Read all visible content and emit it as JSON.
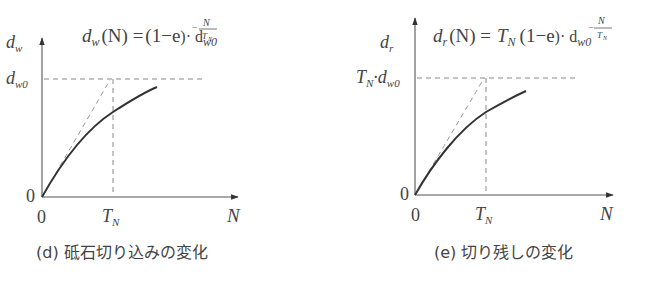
{
  "figures": [
    {
      "id": "d",
      "caption": "(d) 砥石切り込みの変化",
      "formula": {
        "lhs": "d",
        "lhs_sub": "w",
        "lhs_arg": "(N) =",
        "pre": "",
        "pre_sub": "",
        "body": "(1−e",
        "exp_num": "N",
        "exp_den": "T",
        "exp_den_sub": "N",
        "tail": ")· d",
        "tail_sub": "w0"
      },
      "y_label": "d",
      "y_label_sub": "w",
      "y_level_label": "d",
      "y_level_label_sub": "w0",
      "y_level_prefix": "",
      "y_level_prefix_sub": "",
      "origin_y_label": "0",
      "origin_x_label": "0",
      "tn_label": "T",
      "tn_label_sub": "N",
      "x_label": "N"
    },
    {
      "id": "e",
      "caption": "(e) 切り残しの変化",
      "formula": {
        "lhs": "d",
        "lhs_sub": "r",
        "lhs_arg": "(N) =",
        "pre": "T",
        "pre_sub": "N",
        "body": "(1−e",
        "exp_num": "N",
        "exp_den": "T",
        "exp_den_sub": "N",
        "tail": ")· d",
        "tail_sub": "w0"
      },
      "y_label": "d",
      "y_label_sub": "r",
      "y_level_label": "·d",
      "y_level_label_sub": "w0",
      "y_level_prefix": "T",
      "y_level_prefix_sub": "N",
      "origin_y_label": "0",
      "origin_x_label": "0",
      "tn_label": "T",
      "tn_label_sub": "N",
      "x_label": "N"
    }
  ],
  "colors": {
    "axis": "#555555",
    "curve": "#333333",
    "dashed": "#888888",
    "text": "#444444"
  }
}
